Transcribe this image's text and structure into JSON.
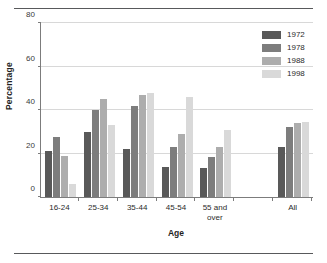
{
  "chart_data": {
    "type": "bar",
    "title": "",
    "xlabel": "Age",
    "ylabel": "Percentage",
    "ylim": [
      0,
      80
    ],
    "yticks": [
      0,
      20,
      40,
      60,
      80
    ],
    "grid": true,
    "legend_position": "top-right",
    "categories": [
      "16-24",
      "25-34",
      "35-44",
      "45-54",
      "55 and over",
      "",
      "All"
    ],
    "series": [
      {
        "name": "1972",
        "color": "#595959",
        "values": [
          21,
          30,
          22,
          14,
          13.5,
          null,
          23
        ]
      },
      {
        "name": "1978",
        "color": "#7d7d7d",
        "values": [
          27.5,
          40,
          42,
          23,
          18.5,
          null,
          32
        ]
      },
      {
        "name": "1988",
        "color": "#adadad",
        "values": [
          19,
          45,
          47,
          29,
          23,
          null,
          34
        ]
      },
      {
        "name": "1998",
        "color": "#d9d9d9",
        "values": [
          6,
          33,
          48,
          46,
          31,
          null,
          34.5
        ]
      }
    ]
  },
  "axes": {
    "y_title": "Percentage",
    "x_title": "Age",
    "y_tick_labels": [
      "0",
      "20",
      "40",
      "60",
      "80"
    ],
    "x_tick_labels": [
      "16-24",
      "25-34",
      "35-44",
      "45-54",
      "55 and over",
      "",
      "All"
    ]
  },
  "legend": {
    "items": [
      {
        "label": "1972",
        "color": "#595959"
      },
      {
        "label": "1978",
        "color": "#7d7d7d"
      },
      {
        "label": "1988",
        "color": "#adadad"
      },
      {
        "label": "1998",
        "color": "#d9d9d9"
      }
    ]
  },
  "colors": {
    "axis": "#7c7c7c",
    "grid": "#d8d8d8",
    "rule": "#58595b",
    "text": "#2b2b2b",
    "background": "#ffffff"
  }
}
